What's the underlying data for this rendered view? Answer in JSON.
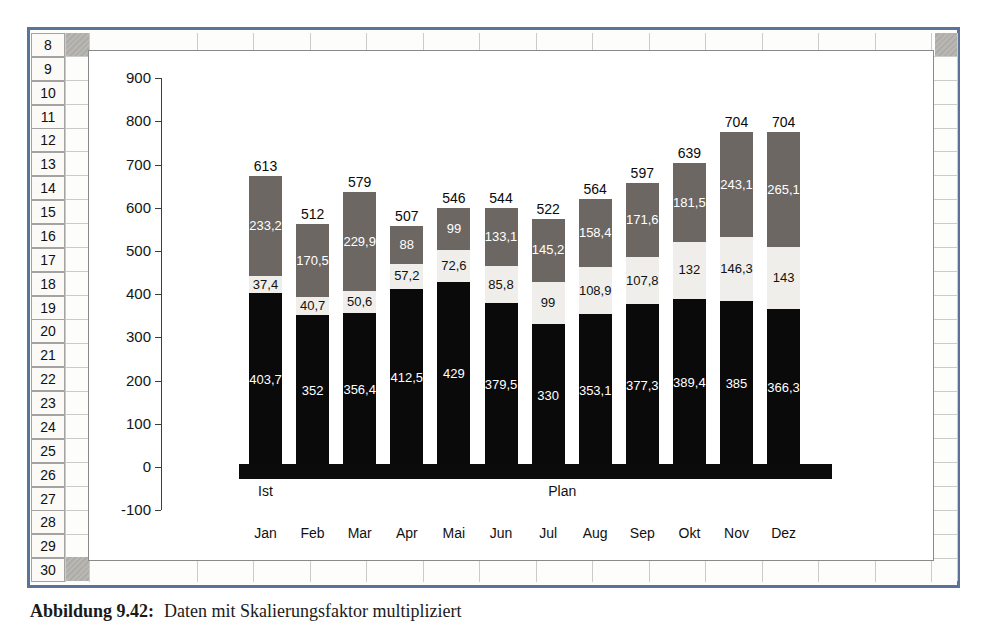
{
  "spreadsheet": {
    "row_numbers": [
      "8",
      "9",
      "10",
      "11",
      "12",
      "13",
      "14",
      "15",
      "16",
      "17",
      "18",
      "19",
      "20",
      "21",
      "22",
      "23",
      "24",
      "25",
      "26",
      "27",
      "28",
      "29",
      "30"
    ]
  },
  "caption": {
    "label": "Abbildung 9.42:",
    "text": "Daten mit Skalierungsfaktor multipliziert"
  },
  "chart_data": {
    "type": "bar",
    "stacked": true,
    "title": "",
    "xlabel": "",
    "ylabel": "",
    "ylim": [
      -100,
      900
    ],
    "grid": false,
    "legend": "none",
    "yticks": [
      900,
      800,
      700,
      600,
      500,
      400,
      300,
      200,
      100,
      0,
      -100
    ],
    "ytick_labels": [
      "900",
      "800",
      "700",
      "600",
      "500",
      "400",
      "300",
      "200",
      "100",
      "0",
      "-100"
    ],
    "categories": [
      "Jan",
      "Feb",
      "Mar",
      "Apr",
      "Mai",
      "Jun",
      "Jul",
      "Aug",
      "Sep",
      "Okt",
      "Nov",
      "Dez"
    ],
    "group_labels": [
      {
        "label": "Ist",
        "x_index": 0
      },
      {
        "label": "Plan",
        "x_index": 6.3
      }
    ],
    "series": [
      {
        "name": "bottom-segment",
        "color": "#0a0a0a",
        "label_color": "#ffffff",
        "values": [
          403.7,
          352,
          356.4,
          412.5,
          429,
          379.5,
          330,
          353.1,
          377.3,
          389.4,
          385,
          366.3
        ],
        "labels": [
          "403,7",
          "352",
          "356,4",
          "412,5",
          "429",
          "379,5",
          "330",
          "353,1",
          "377,3",
          "389,4",
          "385",
          "366,3"
        ]
      },
      {
        "name": "middle-segment",
        "color": "#efeeea",
        "label_color": "#111111",
        "values": [
          37.4,
          40.7,
          50.6,
          57.2,
          72.6,
          85.8,
          99,
          108.9,
          107.8,
          132,
          146.3,
          143
        ],
        "labels": [
          "37,4",
          "40,7",
          "50,6",
          "57,2",
          "72,6",
          "85,8",
          "99",
          "108,9",
          "107,8",
          "132",
          "146,3",
          "143"
        ]
      },
      {
        "name": "top-segment",
        "color": "#6c6763",
        "label_color": "#ffffff",
        "values": [
          233.2,
          170.5,
          229.9,
          88,
          99,
          133.1,
          145.2,
          158.4,
          171.6,
          181.5,
          243.1,
          265.1
        ],
        "labels": [
          "233,2",
          "170,5",
          "229,9",
          "88",
          "99",
          "133,1",
          "145,2",
          "158,4",
          "171,6",
          "181,5",
          "243,1",
          "265,1"
        ]
      }
    ],
    "totals": [
      613,
      512,
      579,
      507,
      546,
      544,
      522,
      564,
      597,
      639,
      704,
      704
    ],
    "totals_labels": [
      "613",
      "512",
      "579",
      "507",
      "546",
      "544",
      "522",
      "564",
      "597",
      "639",
      "704",
      "704"
    ],
    "axis_color": "#3c3c3c",
    "x_band_color": "#0b0b0b"
  }
}
